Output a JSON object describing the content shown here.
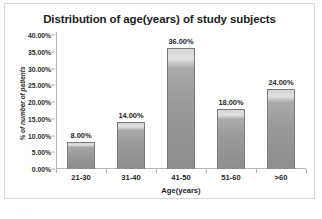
{
  "chart_data": {
    "type": "bar",
    "title": "Distribution of age(years) of study subjects",
    "xlabel": "Age(years)",
    "ylabel": "% of number of patients",
    "categories": [
      "21-30",
      "31-40",
      "41-50",
      "51-60",
      ">60"
    ],
    "values": [
      8,
      14,
      36,
      18,
      24
    ],
    "value_labels": [
      "8.00%",
      "14.00%",
      "36.00%",
      "18.00%",
      "24.00%"
    ],
    "ylim": [
      0,
      40
    ],
    "ytick_values": [
      0,
      5,
      10,
      15,
      20,
      25,
      30,
      35,
      40
    ],
    "ytick_labels": [
      "0.00%",
      "5.00%",
      "10.00%",
      "15.00%",
      "20.00%",
      "25.00%",
      "30.00%",
      "35.00%",
      "40.00%"
    ],
    "grid": false,
    "legend": null,
    "legend_position": "none",
    "series": [
      {
        "name": "% of number of patients",
        "values": [
          8,
          14,
          36,
          18,
          24
        ]
      }
    ],
    "colors": {
      "bar_fill": "#9a9a9a",
      "bar_highlight": "#e2e2e2",
      "bar_border": "#7b7b7b",
      "axis_line": "#b5b5b5",
      "text": "#1f1f1f",
      "frame_border": "#d8d8d8",
      "background": "#ffffff"
    }
  },
  "caption": {
    "artifact_text": "...."
  }
}
